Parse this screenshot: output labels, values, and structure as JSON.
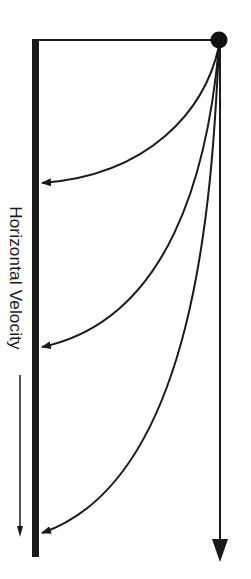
{
  "diagram": {
    "label": "Horizontal Velocity",
    "colors": {
      "ink": "#1a1a1a",
      "background": "#ffffff"
    },
    "elements": {
      "ball": {
        "cx": 219,
        "cy": 40,
        "r": 8
      },
      "wall": {
        "x": 35,
        "y_top": 39,
        "y_bottom": 557
      },
      "top_line": {
        "from": [
          35,
          40
        ],
        "to": [
          219,
          40
        ]
      },
      "trajectories": [
        {
          "name": "trajectory-1",
          "impact_y": 183
        },
        {
          "name": "trajectory-2",
          "impact_y": 347
        },
        {
          "name": "trajectory-3",
          "impact_y": 533
        },
        {
          "name": "trajectory-vertical",
          "end_y": 560
        }
      ],
      "direction_arrow": {
        "x": 20,
        "y_start": 375,
        "y_end": 537
      }
    }
  }
}
